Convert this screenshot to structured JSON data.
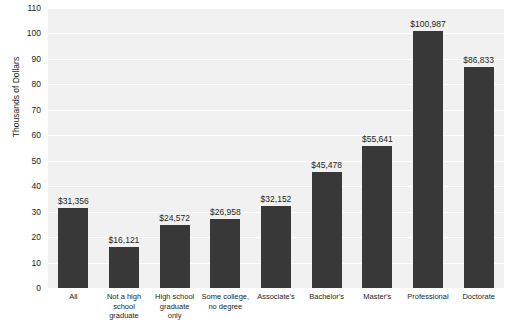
{
  "watermark": "",
  "chart_data": {
    "type": "bar",
    "title": "",
    "xlabel": "",
    "ylabel": "Thousands of Dollars",
    "ylim": [
      0,
      110
    ],
    "ytick_step": 10,
    "yticks": [
      0,
      10,
      20,
      30,
      40,
      50,
      60,
      70,
      80,
      90,
      100,
      110
    ],
    "grid": true,
    "legend": "none",
    "bar_color": "#383838",
    "plot_background": "#f1f1f1",
    "gridline_color": "#ffffff",
    "categories": [
      "All",
      "Not a high school graduate",
      "High school graduate only",
      "Some college, no degree",
      "Associate's",
      "Bachelor's",
      "Master's",
      "Professional",
      "Doctorate"
    ],
    "category_lines": [
      [
        "All"
      ],
      [
        "Not a high",
        "school",
        "graduate"
      ],
      [
        "High school",
        "graduate",
        "only"
      ],
      [
        "Some college,",
        "no degree"
      ],
      [
        "Associate's"
      ],
      [
        "Bachelor's"
      ],
      [
        "Master's"
      ],
      [
        "Professional"
      ],
      [
        "Doctorate"
      ]
    ],
    "values": [
      31356,
      16121,
      24572,
      26958,
      32152,
      45478,
      55641,
      100987,
      86833
    ],
    "value_labels": [
      "$31,356",
      "$16,121",
      "$24,572",
      "$26,958",
      "$32,152",
      "$45,478",
      "$55,641",
      "$100,987",
      "$86,833"
    ]
  }
}
